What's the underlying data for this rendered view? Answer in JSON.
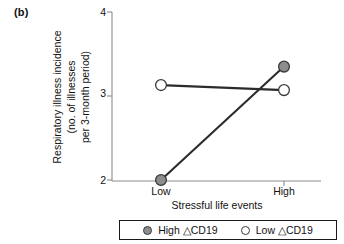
{
  "panel": {
    "label": "(b)"
  },
  "chart_data": {
    "type": "line",
    "title": "",
    "subtitle": "",
    "xlabel": "Stressful life events",
    "ylabel": "Respiratory illness incidence (no. of illnesses per 3-month period)",
    "ylabel_lines": [
      "Respiratory illness incidence",
      "(no. of illnesses",
      "per 3-month period)"
    ],
    "categories": [
      "Low",
      "High"
    ],
    "xticklabels": [
      "Low",
      "High"
    ],
    "yticks": [
      2,
      3,
      4
    ],
    "yticklabels": [
      "2",
      "3",
      "4"
    ],
    "ylim": [
      2,
      4
    ],
    "grid": false,
    "legend_position": "bottom",
    "series": [
      {
        "name": "High △CD19",
        "values": [
          2.0,
          3.35
        ],
        "marker": "filled-circle",
        "marker_color": "#8d8d8d",
        "marker_edge_color": "#3a3a3a",
        "line_color": "#2b2b2b"
      },
      {
        "name": "Low △CD19",
        "values": [
          3.13,
          3.07
        ],
        "marker": "open-circle",
        "marker_color": "#ffffff",
        "marker_edge_color": "#3a3a3a",
        "line_color": "#2b2b2b"
      }
    ]
  },
  "legend": {
    "items": [
      {
        "label": "High △CD19",
        "swatch": "filled-circle-icon",
        "color": "#8d8d8d"
      },
      {
        "label": "Low △CD19",
        "swatch": "open-circle-icon",
        "color": "#ffffff"
      }
    ]
  },
  "axis": {
    "line_color": "#8c8c8c"
  }
}
